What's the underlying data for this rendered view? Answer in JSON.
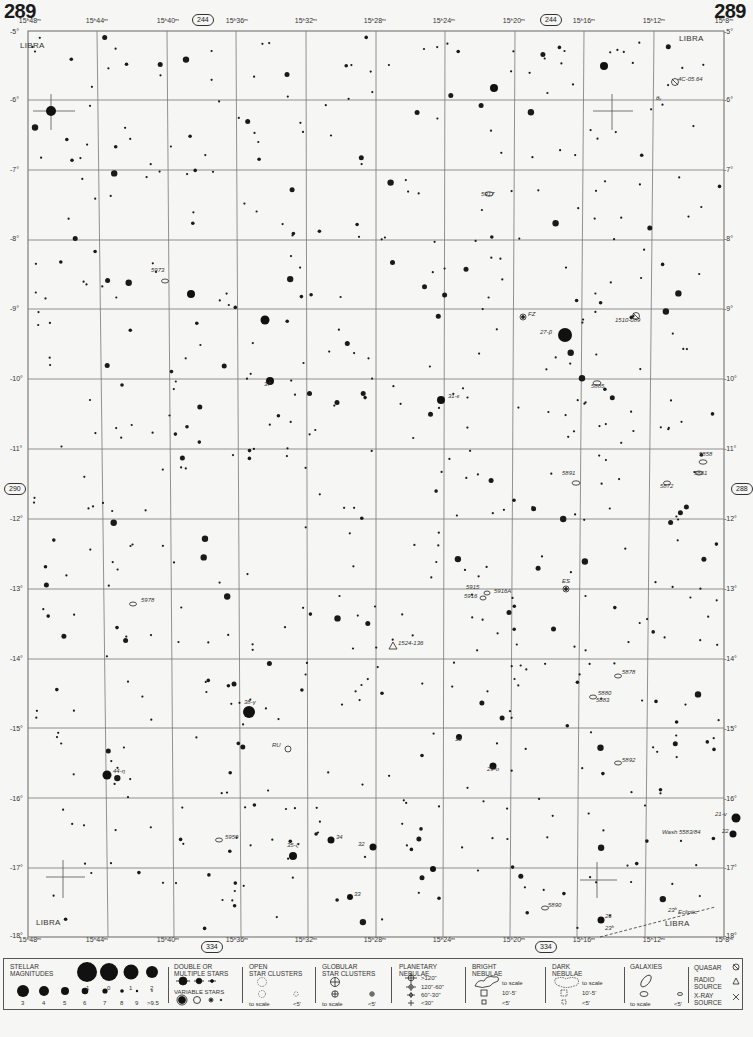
{
  "page": {
    "number_left": "289",
    "number_right": "289",
    "adjacent_pages": {
      "top": "244",
      "bottom": "334",
      "left": "290",
      "right": "288"
    }
  },
  "constellation_labels": [
    {
      "text": "LIBRA",
      "x": 36,
      "y": 47
    },
    {
      "text": "LIBRA",
      "x": 695,
      "y": 40
    },
    {
      "text": "LIBRA",
      "x": 52,
      "y": 924
    },
    {
      "text": "LIBRA",
      "x": 681,
      "y": 925
    }
  ],
  "ra_labels": [
    {
      "text": "15ʰ48ᵐ",
      "x": 30
    },
    {
      "text": "15ʰ44ᵐ",
      "x": 97
    },
    {
      "text": "15ʰ40ᵐ",
      "x": 168
    },
    {
      "text": "15ʰ36ᵐ",
      "x": 237
    },
    {
      "text": "15ʰ32ᵐ",
      "x": 306
    },
    {
      "text": "15ʰ28ᵐ",
      "x": 375
    },
    {
      "text": "15ʰ24ᵐ",
      "x": 444
    },
    {
      "text": "15ʰ20ᵐ",
      "x": 514
    },
    {
      "text": "15ʰ16ᵐ",
      "x": 584
    },
    {
      "text": "15ʰ12ᵐ",
      "x": 654
    },
    {
      "text": "15ʰ8ᵐ",
      "x": 724
    }
  ],
  "dec_labels": [
    {
      "text": "-5°",
      "y": 33
    },
    {
      "text": "-6°",
      "y": 101
    },
    {
      "text": "-7°",
      "y": 171
    },
    {
      "text": "-8°",
      "y": 240
    },
    {
      "text": "-9°",
      "y": 310
    },
    {
      "text": "-10°",
      "y": 380
    },
    {
      "text": "-11°",
      "y": 450
    },
    {
      "text": "-12°",
      "y": 520
    },
    {
      "text": "-13°",
      "y": 590
    },
    {
      "text": "-14°",
      "y": 660
    },
    {
      "text": "-15°",
      "y": 730
    },
    {
      "text": "-16°",
      "y": 800
    },
    {
      "text": "-17°",
      "y": 869
    },
    {
      "text": "-18°",
      "y": 937
    }
  ],
  "object_labels": [
    {
      "text": "4C-05.64",
      "x": 678,
      "y": 80
    },
    {
      "text": "θᵧ",
      "x": 656,
      "y": 99
    },
    {
      "text": "5917",
      "x": 481,
      "y": 195
    },
    {
      "text": "5973",
      "x": 151,
      "y": 271
    },
    {
      "text": "FZ",
      "x": 528,
      "y": 315
    },
    {
      "text": "27-β",
      "x": 540,
      "y": 333
    },
    {
      "text": "1510-089",
      "x": 615,
      "y": 321
    },
    {
      "text": "37",
      "x": 264,
      "y": 385
    },
    {
      "text": "31-ε",
      "x": 448,
      "y": 397
    },
    {
      "text": "5885",
      "x": 591,
      "y": 387
    },
    {
      "text": "5858",
      "x": 699,
      "y": 455
    },
    {
      "text": "5861",
      "x": 694,
      "y": 474
    },
    {
      "text": "5891",
      "x": 562,
      "y": 474
    },
    {
      "text": "5872",
      "x": 660,
      "y": 487
    },
    {
      "text": "ES",
      "x": 562,
      "y": 582
    },
    {
      "text": "5915",
      "x": 466,
      "y": 588
    },
    {
      "text": "5916A",
      "x": 494,
      "y": 592
    },
    {
      "text": "5916",
      "x": 464,
      "y": 597
    },
    {
      "text": "5978",
      "x": 141,
      "y": 601
    },
    {
      "text": "1524-136",
      "x": 398,
      "y": 644
    },
    {
      "text": "5878",
      "x": 622,
      "y": 673
    },
    {
      "text": "5880",
      "x": 598,
      "y": 694
    },
    {
      "text": "5883",
      "x": 596,
      "y": 701
    },
    {
      "text": "38-γ",
      "x": 244,
      "y": 703
    },
    {
      "text": "RU",
      "x": 272,
      "y": 746
    },
    {
      "text": "30",
      "x": 455,
      "y": 740
    },
    {
      "text": "29-ο",
      "x": 487,
      "y": 770
    },
    {
      "text": "5892",
      "x": 622,
      "y": 761
    },
    {
      "text": "44-η",
      "x": 113,
      "y": 772
    },
    {
      "text": "21-ν",
      "x": 715,
      "y": 815
    },
    {
      "text": "22",
      "x": 722,
      "y": 832
    },
    {
      "text": "Wash 5583/84",
      "x": 662,
      "y": 833
    },
    {
      "text": "5959",
      "x": 225,
      "y": 838
    },
    {
      "text": "34",
      "x": 336,
      "y": 838
    },
    {
      "text": "35-ζ",
      "x": 287,
      "y": 846
    },
    {
      "text": "32",
      "x": 358,
      "y": 845
    },
    {
      "text": "33",
      "x": 354,
      "y": 895
    },
    {
      "text": "5890",
      "x": 548,
      "y": 906
    },
    {
      "text": "26",
      "x": 605,
      "y": 917
    },
    {
      "text": "Ecliptic",
      "x": 678,
      "y": 913
    },
    {
      "text": "23ʰ",
      "x": 668,
      "y": 911
    },
    {
      "text": "23ʰ",
      "x": 605,
      "y": 929
    }
  ],
  "legend": {
    "stellar_magnitudes": {
      "title_1": "STELLAR",
      "title_2": "MAGNITUDES",
      "row1": [
        "-1",
        "0",
        "1",
        "2"
      ],
      "row2": [
        "3",
        "4",
        "5",
        "6",
        "7",
        "8",
        "9",
        ">9.5"
      ]
    },
    "double_stars": {
      "title_1": "DOUBLE OR",
      "title_2": "MULTIPLE STARS"
    },
    "variable_stars": {
      "title": "VARIABLE STARS"
    },
    "open_clusters": {
      "title_1": "OPEN",
      "title_2": "STAR CLUSTERS",
      "to_scale": "to scale",
      "small": "<5'"
    },
    "globular_clusters": {
      "title_1": "GLOBULAR",
      "title_2": "STAR CLUSTERS",
      "to_scale": "to scale",
      "small": "<5'"
    },
    "planetary_nebulae": {
      "title_1": "PLANETARY",
      "title_2": "NEBULAE",
      "sizes": [
        ">120\"",
        "120\"-60\"",
        "60\"-30\"",
        "<30\""
      ]
    },
    "bright_nebulae": {
      "title_1": "BRIGHT",
      "title_2": "NEBULAE",
      "to_scale": "to scale",
      "mid": "10'-5'",
      "small": "<5'"
    },
    "dark_nebulae": {
      "title_1": "DARK",
      "title_2": "NEBULAE",
      "to_scale": "to scale",
      "mid": "10'-5'",
      "small": "<5'"
    },
    "galaxies": {
      "title": "GALAXIES",
      "to_scale": "to scale",
      "small": "<5'"
    },
    "special": {
      "quasar": "QUASAR",
      "radio_1": "RADIO",
      "radio_2": "SOURCE",
      "xray_1": "X-RAY",
      "xray_2": "SOURCE"
    }
  },
  "colors": {
    "ink": "#1a1a1a",
    "grid": "#666666",
    "paper": "#f6f6f4"
  }
}
